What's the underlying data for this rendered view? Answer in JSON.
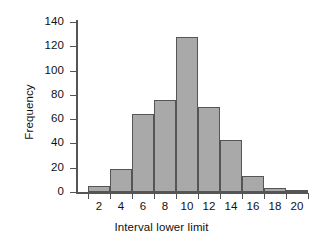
{
  "chart_data": {
    "type": "bar",
    "title": "",
    "subtitle": "",
    "xlabel": "Interval lower limit",
    "ylabel": "Frequency",
    "xlim": [
      0,
      21
    ],
    "ylim": [
      0,
      140
    ],
    "grid": false,
    "legend": null,
    "bar_style": {
      "fill": "#a9a9a9",
      "edge": "#555555",
      "width_units": 2,
      "gap": 0
    },
    "categories": [
      1,
      3,
      5,
      7,
      9,
      11,
      13,
      15,
      17,
      19
    ],
    "values": [
      5,
      19,
      64,
      76,
      128,
      70,
      43,
      13,
      3,
      1
    ],
    "bars": [
      {
        "lower_limit": 1,
        "upper_limit": 3,
        "frequency": 5
      },
      {
        "lower_limit": 3,
        "upper_limit": 5,
        "frequency": 19
      },
      {
        "lower_limit": 5,
        "upper_limit": 7,
        "frequency": 64
      },
      {
        "lower_limit": 7,
        "upper_limit": 9,
        "frequency": 76
      },
      {
        "lower_limit": 9,
        "upper_limit": 11,
        "frequency": 128
      },
      {
        "lower_limit": 11,
        "upper_limit": 13,
        "frequency": 70
      },
      {
        "lower_limit": 13,
        "upper_limit": 15,
        "frequency": 43
      },
      {
        "lower_limit": 15,
        "upper_limit": 17,
        "frequency": 13
      },
      {
        "lower_limit": 17,
        "upper_limit": 19,
        "frequency": 3
      },
      {
        "lower_limit": 19,
        "upper_limit": 21,
        "frequency": 1
      }
    ],
    "x_ticks": [
      2,
      4,
      6,
      8,
      10,
      12,
      14,
      16,
      18,
      20
    ],
    "x_tick_labels": [
      "2",
      "4",
      "6",
      "8",
      "10",
      "12",
      "14",
      "16",
      "18",
      "20"
    ],
    "y_ticks": [
      0,
      20,
      40,
      60,
      80,
      100,
      120,
      140
    ],
    "y_tick_labels": [
      "0",
      "20",
      "40",
      "60",
      "80",
      "100",
      "120",
      "140"
    ]
  },
  "axes": {
    "x_title": "Interval lower limit",
    "y_title": "Frequency"
  }
}
